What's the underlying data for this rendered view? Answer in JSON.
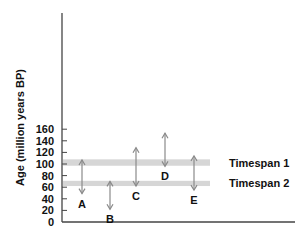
{
  "chart_data": {
    "type": "range-arrows",
    "title": "",
    "xlabel": "",
    "ylabel": "Age (million years BP)",
    "ylim": [
      0,
      175
    ],
    "yticks": [
      0,
      20,
      40,
      60,
      80,
      100,
      120,
      140,
      160
    ],
    "grid": false,
    "bands": [
      {
        "name": "Timespan 1",
        "from": 97,
        "to": 108,
        "color": "#d6d6d6"
      },
      {
        "name": "Timespan 2",
        "from": 62,
        "to": 71,
        "color": "#d6d6d6"
      }
    ],
    "series": [
      {
        "name": "A",
        "top": 107,
        "bottom": 49
      },
      {
        "name": "B",
        "top": 70,
        "bottom": 22
      },
      {
        "name": "C",
        "top": 128,
        "bottom": 62
      },
      {
        "name": "D",
        "top": 153,
        "bottom": 96
      },
      {
        "name": "E",
        "top": 114,
        "bottom": 55
      }
    ],
    "arrow_color": "#8a8a8a"
  }
}
